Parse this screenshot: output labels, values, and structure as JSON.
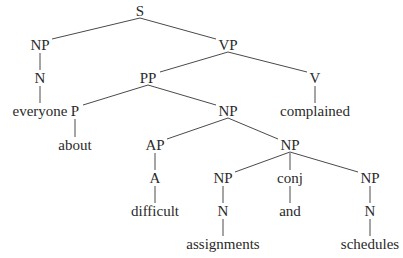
{
  "tree": {
    "title": "Syntax tree: everyone about difficult assignments and schedules complained",
    "nodes": [
      {
        "id": "s",
        "label": "S",
        "x": 140,
        "y": 11
      },
      {
        "id": "np1",
        "label": "NP",
        "x": 40,
        "y": 45
      },
      {
        "id": "n1",
        "label": "N",
        "x": 40,
        "y": 78
      },
      {
        "id": "w_everyone",
        "label": "everyone",
        "x": 40,
        "y": 111
      },
      {
        "id": "vp",
        "label": "VP",
        "x": 228,
        "y": 45
      },
      {
        "id": "pp",
        "label": "PP",
        "x": 148,
        "y": 78
      },
      {
        "id": "v",
        "label": "V",
        "x": 315,
        "y": 78
      },
      {
        "id": "w_complained",
        "label": "complained",
        "x": 315,
        "y": 111
      },
      {
        "id": "p",
        "label": "P",
        "x": 75,
        "y": 111
      },
      {
        "id": "w_about",
        "label": "about",
        "x": 75,
        "y": 145
      },
      {
        "id": "np2",
        "label": "NP",
        "x": 228,
        "y": 111
      },
      {
        "id": "ap",
        "label": "AP",
        "x": 155,
        "y": 145
      },
      {
        "id": "a",
        "label": "A",
        "x": 155,
        "y": 178
      },
      {
        "id": "w_difficult",
        "label": "difficult",
        "x": 155,
        "y": 211
      },
      {
        "id": "np3",
        "label": "NP",
        "x": 290,
        "y": 145
      },
      {
        "id": "np4",
        "label": "NP",
        "x": 223,
        "y": 178
      },
      {
        "id": "n2",
        "label": "N",
        "x": 223,
        "y": 211
      },
      {
        "id": "w_assignments",
        "label": "assignments",
        "x": 223,
        "y": 244
      },
      {
        "id": "conj",
        "label": "conj",
        "x": 290,
        "y": 178
      },
      {
        "id": "w_and",
        "label": "and",
        "x": 290,
        "y": 211
      },
      {
        "id": "np5",
        "label": "NP",
        "x": 370,
        "y": 178
      },
      {
        "id": "n3",
        "label": "N",
        "x": 370,
        "y": 211
      },
      {
        "id": "w_schedules",
        "label": "schedules",
        "x": 370,
        "y": 244
      }
    ],
    "edges": [
      [
        "s",
        "np1"
      ],
      [
        "s",
        "vp"
      ],
      [
        "np1",
        "n1"
      ],
      [
        "n1",
        "w_everyone"
      ],
      [
        "vp",
        "pp"
      ],
      [
        "vp",
        "v"
      ],
      [
        "v",
        "w_complained"
      ],
      [
        "pp",
        "p"
      ],
      [
        "pp",
        "np2"
      ],
      [
        "p",
        "w_about"
      ],
      [
        "np2",
        "ap"
      ],
      [
        "np2",
        "np3"
      ],
      [
        "ap",
        "a"
      ],
      [
        "a",
        "w_difficult"
      ],
      [
        "np3",
        "np4"
      ],
      [
        "np3",
        "conj"
      ],
      [
        "np3",
        "np5"
      ],
      [
        "np4",
        "n2"
      ],
      [
        "n2",
        "w_assignments"
      ],
      [
        "conj",
        "w_and"
      ],
      [
        "np5",
        "n3"
      ],
      [
        "n3",
        "w_schedules"
      ]
    ],
    "line_color": "#4a4a4a"
  }
}
